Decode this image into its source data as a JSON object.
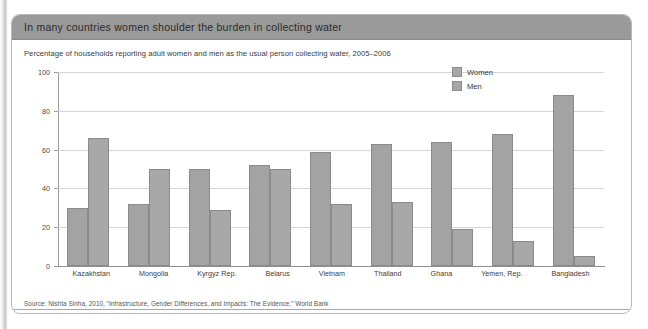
{
  "panel": {
    "title": "In many countries women shoulder the burden in collecting water",
    "subtitle": "Percentage of households reporting adult women and men as the usual person collecting water, 2005–2006",
    "source": "Source: Nishta Sinha, 2010, “Infrastructure, Gender Differences, and Impacts: The Evidence,” World Bank"
  },
  "legend": {
    "position": "top-right",
    "items": [
      {
        "label": "Women",
        "color": "#a3a3a3"
      },
      {
        "label": "Men",
        "color": "#a8a8a8"
      }
    ]
  },
  "chart_data": {
    "type": "bar",
    "title": "In many countries women shoulder the burden in collecting water",
    "subtitle": "Percentage of households reporting adult women and men as the usual person collecting water, 2005–2006",
    "xlabel": "",
    "ylabel": "",
    "ylim": [
      0,
      100
    ],
    "yticks": [
      0,
      20,
      40,
      60,
      80,
      100
    ],
    "grid": "horizontal",
    "legend_position": "top-right",
    "categories": [
      "Kazakhstan",
      "Mongolia",
      "Kyrgyz Rep.",
      "Belarus",
      "Vietnam",
      "Thailand",
      "Ghana",
      "Yemen, Rep.",
      "Bangladesh"
    ],
    "series": [
      {
        "name": "Women",
        "color": "#a3a3a3",
        "values": [
          30,
          32,
          50,
          52,
          59,
          63,
          64,
          68,
          88
        ]
      },
      {
        "name": "Men",
        "color": "#a8a8a8",
        "values": [
          66,
          50,
          29,
          50,
          32,
          33,
          19,
          13,
          5
        ]
      }
    ],
    "source": "Source: Nishta Sinha, 2010, “Infrastructure, Gender Differences, and Impacts: The Evidence,” World Bank"
  }
}
